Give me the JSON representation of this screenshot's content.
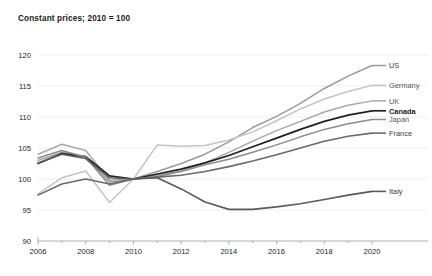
{
  "chart_data": {
    "type": "line",
    "title": "Constant prices; 2010 = 100",
    "xlabel": "",
    "ylabel": "",
    "xlim": [
      2006,
      2020
    ],
    "ylim": [
      90,
      120
    ],
    "yticks": [
      90,
      95,
      100,
      105,
      110,
      115,
      120
    ],
    "xticks": [
      2006,
      2008,
      2010,
      2012,
      2014,
      2016,
      2018,
      2020
    ],
    "xticks_minor": [
      2007,
      2009,
      2011,
      2013,
      2015,
      2017,
      2019
    ],
    "grid": true,
    "legend_position": "right-endpoint-labels",
    "x": [
      2006,
      2007,
      2008,
      2009,
      2010,
      2011,
      2012,
      2013,
      2014,
      2015,
      2016,
      2017,
      2018,
      2019,
      2020
    ],
    "series": [
      {
        "name": "US",
        "label": "US",
        "color": "#9a9a9a",
        "width": 1.5,
        "label_y": 118.3,
        "values": [
          103.0,
          104.3,
          103.6,
          99.5,
          100.0,
          101.2,
          102.5,
          104.0,
          106.0,
          108.3,
          110.1,
          112.2,
          114.6,
          116.6,
          118.3
        ]
      },
      {
        "name": "Germany",
        "label": "Germany",
        "color": "#c4c4c4",
        "width": 1.5,
        "label_y": 115.1,
        "values": [
          97.6,
          100.2,
          101.3,
          96.2,
          100.0,
          105.5,
          105.3,
          105.4,
          106.3,
          107.6,
          109.4,
          111.3,
          112.9,
          114.1,
          115.1
        ]
      },
      {
        "name": "UK",
        "label": "UK",
        "color": "#a8a8a8",
        "width": 1.5,
        "label_y": 112.6,
        "values": [
          104.0,
          105.6,
          104.6,
          99.8,
          100.0,
          100.6,
          101.3,
          102.6,
          104.3,
          106.1,
          107.8,
          109.3,
          110.8,
          111.9,
          112.6
        ]
      },
      {
        "name": "Canada",
        "label": "Canada",
        "color": "#231f20",
        "width": 1.7,
        "label_y": 111.0,
        "values": [
          102.5,
          104.1,
          103.6,
          100.5,
          100.0,
          100.8,
          101.6,
          102.6,
          103.8,
          105.2,
          106.6,
          108.0,
          109.3,
          110.3,
          111.0
        ]
      },
      {
        "name": "Japan",
        "label": "Japan",
        "color": "#8c8c8c",
        "width": 1.5,
        "label_y": 109.6,
        "values": [
          103.4,
          104.6,
          103.5,
          99.0,
          100.0,
          100.4,
          101.2,
          102.3,
          103.2,
          104.3,
          105.5,
          106.8,
          108.0,
          108.9,
          109.6
        ]
      },
      {
        "name": "France",
        "label": "France",
        "color": "#6a6a6a",
        "width": 1.6,
        "label_y": 107.4,
        "values": [
          97.4,
          99.2,
          100.0,
          99.2,
          100.0,
          100.3,
          100.6,
          101.2,
          102.0,
          102.9,
          103.9,
          105.0,
          106.1,
          106.9,
          107.4
        ]
      },
      {
        "name": "Italy",
        "label": "Italy",
        "color": "#5a5a5a",
        "width": 1.6,
        "label_y": 98.0,
        "values": [
          102.6,
          104.0,
          103.3,
          100.2,
          100.0,
          100.2,
          98.4,
          96.3,
          95.1,
          95.1,
          95.5,
          96.0,
          96.7,
          97.4,
          98.0
        ]
      }
    ]
  },
  "plot_geometry": {
    "left": 38,
    "right": 372,
    "top": 55,
    "bottom": 241
  }
}
